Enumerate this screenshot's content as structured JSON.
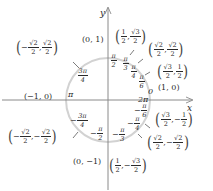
{
  "diagram": {
    "colors": {
      "axis": "#8a8a8a",
      "circle": "#cfcfcf",
      "text": "#2a2a2a",
      "ticks": "#444444"
    },
    "axes": {
      "x_label": "x",
      "y_label": "y"
    },
    "center": [
      108,
      100
    ],
    "radius": 42,
    "points": [
      {
        "id": "p0",
        "coord": "(1, 0)"
      },
      {
        "id": "p90",
        "coord": "(0, 1)"
      },
      {
        "id": "p180",
        "coord": "(−1, 0)"
      },
      {
        "id": "p270",
        "coord": "(0, −1)"
      }
    ],
    "fraction_points": [
      {
        "id": "p60",
        "x": {
          "sign": "",
          "num": "1",
          "den": "2"
        },
        "y": {
          "sign": "",
          "num": "√3",
          "den": "2"
        }
      },
      {
        "id": "p45",
        "x": {
          "sign": "",
          "num": "√2",
          "den": "2"
        },
        "y": {
          "sign": "",
          "num": "√2",
          "den": "2"
        }
      },
      {
        "id": "p30",
        "x": {
          "sign": "",
          "num": "√3",
          "den": "2"
        },
        "y": {
          "sign": "",
          "num": "1",
          "den": "2"
        }
      },
      {
        "id": "p135",
        "x": {
          "sign": "−",
          "num": "√2",
          "den": "2"
        },
        "y": {
          "sign": "",
          "num": "√2",
          "den": "2"
        }
      },
      {
        "id": "p225",
        "x": {
          "sign": "−",
          "num": "√2",
          "den": "2"
        },
        "y": {
          "sign": "−",
          "num": "√2",
          "den": "2"
        }
      },
      {
        "id": "pm30",
        "x": {
          "sign": "",
          "num": "√3",
          "den": "2"
        },
        "y": {
          "sign": "−",
          "num": "1",
          "den": "2"
        }
      },
      {
        "id": "pm45",
        "x": {
          "sign": "",
          "num": "√2",
          "den": "2"
        },
        "y": {
          "sign": "−",
          "num": "√2",
          "den": "2"
        }
      },
      {
        "id": "pm60",
        "x": {
          "sign": "",
          "num": "1",
          "den": "2"
        },
        "y": {
          "sign": "−",
          "num": "√3",
          "den": "2"
        }
      }
    ],
    "angles": {
      "zero": "0",
      "pi": "π",
      "two_pi": "2π",
      "pi_over_2": {
        "sign": "",
        "num": "π",
        "den": "2"
      },
      "pi_over_3": {
        "sign": "",
        "num": "π",
        "den": "3"
      },
      "pi_over_4": {
        "sign": "",
        "num": "π",
        "den": "4"
      },
      "pi_over_6": {
        "sign": "",
        "num": "π",
        "den": "6"
      },
      "three_pi_over_4": {
        "sign": "",
        "num": "3π",
        "den": "4"
      },
      "neg_three_pi_over_4": {
        "sign": "−",
        "num": "3π",
        "den": "4"
      },
      "neg_pi_over_2": {
        "sign": "−",
        "num": "π",
        "den": "2"
      },
      "neg_pi_over_3": {
        "sign": "−",
        "num": "π",
        "den": "3"
      },
      "neg_pi_over_4": {
        "sign": "−",
        "num": "π",
        "den": "4"
      },
      "neg_pi_over_6": {
        "sign": "−",
        "num": "π",
        "den": "6"
      }
    }
  }
}
